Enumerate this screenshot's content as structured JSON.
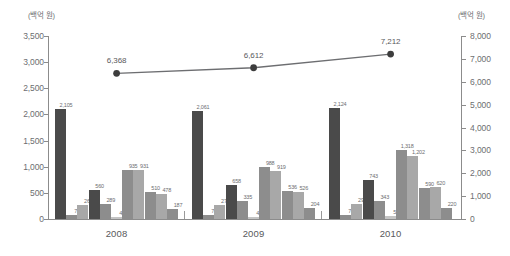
{
  "axes": {
    "left": {
      "unit": "(백억 원)",
      "ticks": [
        "3,500",
        "3,000",
        "2,500",
        "2,000",
        "1,500",
        "1,000",
        "500",
        "0"
      ],
      "min": 0,
      "max": 3500
    },
    "right": {
      "unit": "(백억 원)",
      "ticks": [
        "8,000",
        "7,000",
        "6,000",
        "5,000",
        "4,000",
        "3,000",
        "2,000",
        "1,000",
        "0"
      ],
      "min": 0,
      "max": 8000
    }
  },
  "categories": [
    "2008",
    "2009",
    "2010"
  ],
  "line_labels": [
    "6,368",
    "6,612",
    "7,212"
  ],
  "bar_labels": {
    "g0": [
      "2,105",
      "72",
      "260",
      "560",
      "289",
      "40",
      "935",
      "931",
      "510",
      "478",
      "187"
    ],
    "g1": [
      "2,061",
      "74",
      "274",
      "658",
      "335",
      "42",
      "988",
      "919",
      "536",
      "526",
      "204"
    ],
    "g2": [
      "2,124",
      "74",
      "296",
      "743",
      "343",
      "51",
      "1,318",
      "1,202",
      "590",
      "620",
      "220"
    ]
  },
  "colors": {
    "bar_dark": "#4a4a4a",
    "bar_mid": "#8d8d8d",
    "bar_light": "#a8a8a8",
    "bar_pale": "#c4c4c4",
    "line": "#6d6e71",
    "marker": "#3d3d3d",
    "axis": "#8c8c8c",
    "text": "#6d6e71"
  },
  "chart_data": {
    "type": "bar",
    "title": "",
    "subtitle": "",
    "xlabel": "",
    "ylabel": "(백억 원)",
    "y2label": "(백억 원)",
    "categories": [
      "2008",
      "2009",
      "2010"
    ],
    "ylim": [
      0,
      3500
    ],
    "y2lim": [
      0,
      8000
    ],
    "grid": false,
    "legend": "none",
    "series": [
      {
        "name": "bar-1",
        "type": "bar",
        "axis": "left",
        "values": [
          2105,
          2061,
          2124
        ]
      },
      {
        "name": "bar-2",
        "type": "bar",
        "axis": "left",
        "values": [
          72,
          74,
          74
        ]
      },
      {
        "name": "bar-3",
        "type": "bar",
        "axis": "left",
        "values": [
          260,
          274,
          296
        ]
      },
      {
        "name": "bar-4",
        "type": "bar",
        "axis": "left",
        "values": [
          560,
          658,
          743
        ]
      },
      {
        "name": "bar-5",
        "type": "bar",
        "axis": "left",
        "values": [
          289,
          335,
          343
        ]
      },
      {
        "name": "bar-6",
        "type": "bar",
        "axis": "left",
        "values": [
          40,
          42,
          51
        ]
      },
      {
        "name": "bar-7",
        "type": "bar",
        "axis": "left",
        "values": [
          935,
          988,
          1318
        ]
      },
      {
        "name": "bar-8",
        "type": "bar",
        "axis": "left",
        "values": [
          931,
          919,
          1202
        ]
      },
      {
        "name": "bar-9",
        "type": "bar",
        "axis": "left",
        "values": [
          510,
          536,
          590
        ]
      },
      {
        "name": "bar-10",
        "type": "bar",
        "axis": "left",
        "values": [
          478,
          526,
          620
        ]
      },
      {
        "name": "bar-11",
        "type": "bar",
        "axis": "left",
        "values": [
          187,
          204,
          220
        ]
      },
      {
        "name": "line-1",
        "type": "line",
        "axis": "right",
        "values": [
          6368,
          6612,
          7212
        ]
      }
    ]
  }
}
